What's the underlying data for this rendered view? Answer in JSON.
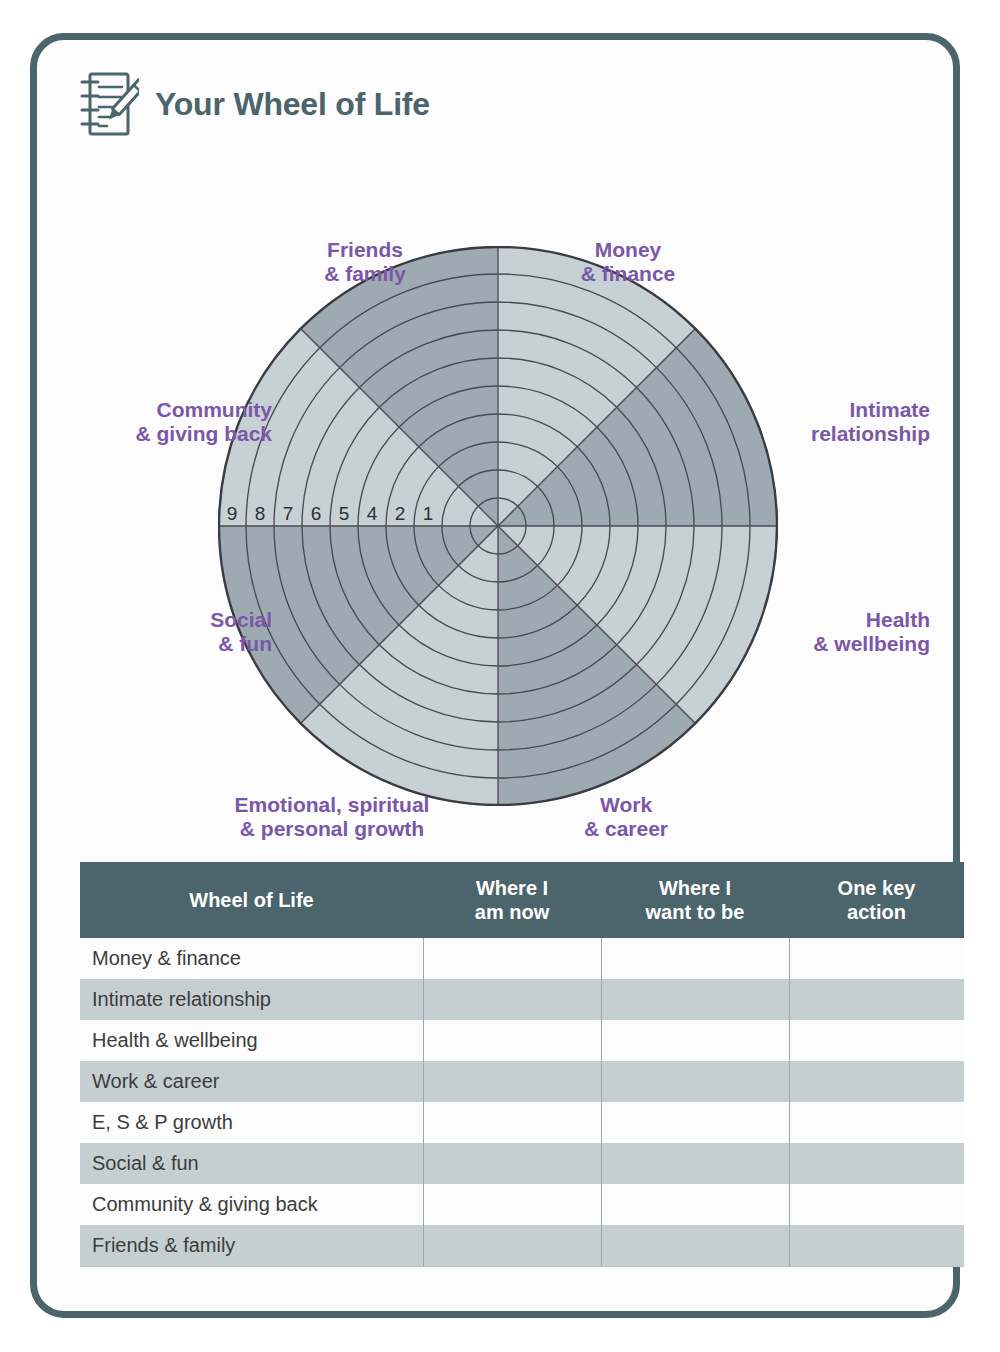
{
  "header": {
    "title": "Your Wheel of Life",
    "icon": "notepad-pencil-icon"
  },
  "colors": {
    "border": "#4c646b",
    "title": "#4c646b",
    "label_purple": "#7b57a8",
    "segment_dark": "#9eaab2",
    "segment_light": "#c7d1d5",
    "table_header_bg": "#4c646b",
    "table_row_alt_bg": "#c5cfd2",
    "card_bg": "#fbfcfb"
  },
  "wheel": {
    "scale_labels": [
      "10",
      "9",
      "8",
      "7",
      "6",
      "5",
      "4",
      "2",
      "1"
    ],
    "ring_count": 10,
    "segment_count": 8,
    "segments": [
      {
        "label": "Friends\n& family",
        "shade": "dark",
        "position": "top-left"
      },
      {
        "label": "Money\n& finance",
        "shade": "light",
        "position": "top-right"
      },
      {
        "label": "Intimate\nrelationship",
        "shade": "dark",
        "position": "right-upper"
      },
      {
        "label": "Health\n& wellbeing",
        "shade": "light",
        "position": "right-lower"
      },
      {
        "label": "Work\n& career",
        "shade": "dark",
        "position": "bottom-right"
      },
      {
        "label": "Emotional, spiritual\n& personal growth",
        "shade": "light",
        "position": "bottom-left"
      },
      {
        "label": "Social\n& fun",
        "shade": "dark",
        "position": "left-lower"
      },
      {
        "label": "Community\n& giving back",
        "shade": "light",
        "position": "left-upper"
      }
    ]
  },
  "table": {
    "headers": [
      "Wheel of Life",
      "Where I\nam now",
      "Where I\nwant to be",
      "One key\naction"
    ],
    "rows": [
      {
        "category": "Money & finance",
        "where_i_am_now": "",
        "where_i_want_to_be": "",
        "one_key_action": ""
      },
      {
        "category": "Intimate relationship",
        "where_i_am_now": "",
        "where_i_want_to_be": "",
        "one_key_action": ""
      },
      {
        "category": "Health & wellbeing",
        "where_i_am_now": "",
        "where_i_want_to_be": "",
        "one_key_action": ""
      },
      {
        "category": "Work & career",
        "where_i_am_now": "",
        "where_i_want_to_be": "",
        "one_key_action": ""
      },
      {
        "category": "E, S & P growth",
        "where_i_am_now": "",
        "where_i_want_to_be": "",
        "one_key_action": ""
      },
      {
        "category": "Social & fun",
        "where_i_am_now": "",
        "where_i_want_to_be": "",
        "one_key_action": ""
      },
      {
        "category": "Community & giving back",
        "where_i_am_now": "",
        "where_i_want_to_be": "",
        "one_key_action": ""
      },
      {
        "category": "Friends & family",
        "where_i_am_now": "",
        "where_i_want_to_be": "",
        "one_key_action": ""
      }
    ]
  }
}
